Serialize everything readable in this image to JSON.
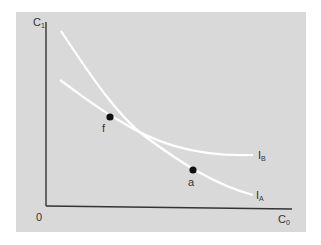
{
  "diagram": {
    "type": "indifference-curves",
    "background": "#d9d9d9",
    "axes": {
      "y_label": "C",
      "y_sub": "1",
      "x_label": "C",
      "x_sub": "0",
      "origin_label": "0",
      "color": "#333333"
    },
    "curves": [
      {
        "name": "I_A",
        "label": "I",
        "sub": "A",
        "color": "#ffffff"
      },
      {
        "name": "I_B",
        "label": "I",
        "sub": "B",
        "color": "#ffffff"
      }
    ],
    "points": [
      {
        "name": "f",
        "label": "f"
      },
      {
        "name": "a",
        "label": "a"
      }
    ]
  }
}
